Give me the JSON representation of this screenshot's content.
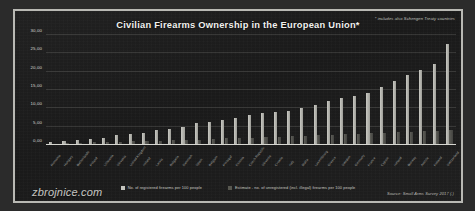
{
  "chart_data": {
    "type": "bar",
    "title": "Civilian Firearms Ownership in the European Union*",
    "footnote": "* includes also Schengen Treaty countries",
    "source": "Source: Small Arms Survey 2017 (.)",
    "watermark": "zbrojnice.com",
    "xlabel": "",
    "ylabel": "",
    "ylim": [
      0,
      30
    ],
    "yticks": [
      "0,00",
      "5,00",
      "10,00",
      "15,00",
      "20,00",
      "25,00",
      "30,00"
    ],
    "ytick_values": [
      0,
      5,
      10,
      15,
      20,
      25,
      30
    ],
    "grid": true,
    "legend_position": "bottom",
    "legend": [
      "No. of registered firearms per 100 people",
      "Estimate - no. of unregistered (incl. illegal) firearms per 100 people"
    ],
    "categories": [
      "Romania",
      "Hungary",
      "Netherlands",
      "Poland",
      "Lithuania",
      "Slovakia",
      "United Kingdom",
      "Ireland",
      "Latvia",
      "Bulgaria",
      "Denmark",
      "Spain",
      "Belgium",
      "Portugal",
      "Estonia",
      "Czech Republic",
      "Slovenia",
      "Croatia",
      "Italy",
      "Malta",
      "Luxembourg",
      "Greece",
      "Sweden",
      "Germany",
      "France",
      "Cyprus",
      "Iceland",
      "Norway",
      "Austria",
      "Finland",
      "Switzerland"
    ],
    "series": [
      {
        "name": "No. of registered firearms per 100 people",
        "color": "#c4c4be",
        "values": [
          0.7,
          1.0,
          1.4,
          1.6,
          1.9,
          2.6,
          3.1,
          3.4,
          4.1,
          4.4,
          4.9,
          6.0,
          6.4,
          6.9,
          7.4,
          8.2,
          8.6,
          9.1,
          9.4,
          10.2,
          11.0,
          12.0,
          12.8,
          13.5,
          14.2,
          15.8,
          17.5,
          19.0,
          20.5,
          22.0,
          27.6
        ]
      },
      {
        "name": "Estimate - no. of unregistered (incl. illegal) firearms per 100 people",
        "color": "#57574f",
        "values": [
          0.4,
          0.5,
          0.6,
          0.7,
          0.8,
          0.9,
          1.0,
          1.1,
          1.2,
          1.3,
          1.4,
          1.5,
          1.7,
          1.8,
          1.9,
          2.0,
          2.1,
          2.3,
          2.4,
          2.5,
          2.6,
          2.8,
          2.9,
          3.0,
          3.2,
          3.3,
          3.5,
          3.6,
          3.8,
          3.9,
          4.1
        ]
      }
    ]
  }
}
